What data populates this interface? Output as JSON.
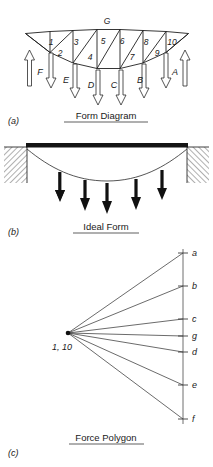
{
  "figure": {
    "background": "#ffffff",
    "ink": "#1a1a1a",
    "width": 213,
    "height": 467
  },
  "panels": [
    {
      "key": "a",
      "tag": "(a)",
      "title": "Form Diagram",
      "title_underlined": true
    },
    {
      "key": "b",
      "tag": "(b)",
      "title": "Ideal Form",
      "title_underlined": true
    },
    {
      "key": "c",
      "tag": "(c)",
      "title": "Force Polygon",
      "title_underlined": true
    }
  ],
  "form_diagram": {
    "top_chord_label": "G",
    "member_numbers": [
      "1",
      "2",
      "3",
      "4",
      "5",
      "6",
      "7",
      "8",
      "9",
      "10"
    ],
    "external_zone_labels": [
      "F",
      "E",
      "D",
      "C",
      "B",
      "A"
    ],
    "reaction_labels": [
      "F",
      "A"
    ],
    "load_labels": [
      "E",
      "D",
      "C",
      "B"
    ],
    "support_reaction_direction": "up",
    "load_direction": "down",
    "top_chord_nodes": [
      {
        "x": 25.5,
        "y": 33.5
      },
      {
        "x": 50.0,
        "y": 31.5
      },
      {
        "x": 73.0,
        "y": 30.5
      },
      {
        "x": 97.0,
        "y": 29.5
      },
      {
        "x": 120.0,
        "y": 29.5
      },
      {
        "x": 143.0,
        "y": 30.5
      },
      {
        "x": 166.0,
        "y": 31.5
      },
      {
        "x": 188.5,
        "y": 33.5
      }
    ],
    "bottom_chord_nodes": [
      {
        "x": 25.5,
        "y": 33.5
      },
      {
        "x": 50.0,
        "y": 52.5
      },
      {
        "x": 73.0,
        "y": 63.0
      },
      {
        "x": 97.0,
        "y": 68.5
      },
      {
        "x": 120.0,
        "y": 68.5
      },
      {
        "x": 143.0,
        "y": 63.0
      },
      {
        "x": 166.0,
        "y": 52.5
      },
      {
        "x": 188.5,
        "y": 33.5
      }
    ],
    "member_number_positions": [
      {
        "label": "1",
        "x": 51,
        "y": 45
      },
      {
        "label": "2",
        "x": 60,
        "y": 55
      },
      {
        "label": "3",
        "x": 76,
        "y": 45
      },
      {
        "label": "4",
        "x": 90,
        "y": 59
      },
      {
        "label": "5",
        "x": 102,
        "y": 44
      },
      {
        "label": "6",
        "x": 122,
        "y": 44
      },
      {
        "label": "7",
        "x": 131,
        "y": 59
      },
      {
        "label": "8",
        "x": 145,
        "y": 45
      },
      {
        "label": "9",
        "x": 158,
        "y": 55
      },
      {
        "label": "10",
        "x": 171,
        "y": 45
      }
    ],
    "zone_label_positions": [
      {
        "label": "F",
        "x": 40,
        "y": 73
      },
      {
        "label": "E",
        "x": 66,
        "y": 80
      },
      {
        "label": "D",
        "x": 94,
        "y": 85
      },
      {
        "label": "C",
        "x": 121,
        "y": 85
      },
      {
        "label": "B",
        "x": 150,
        "y": 80
      },
      {
        "label": "A",
        "x": 175,
        "y": 73
      }
    ],
    "up_arrows": [
      {
        "x": 29.5,
        "y_tip": 52,
        "y_tail": 85
      },
      {
        "x": 185.0,
        "y_tip": 52,
        "y_tail": 85
      }
    ],
    "down_arrows": [
      {
        "x": 51,
        "y_tail": 52,
        "y_tip": 87
      },
      {
        "x": 75,
        "y_tail": 63,
        "y_tip": 97
      },
      {
        "x": 98,
        "y_tail": 69,
        "y_tip": 104
      },
      {
        "x": 121,
        "y_tail": 69,
        "y_tip": 104
      },
      {
        "x": 144,
        "y_tail": 63,
        "y_tip": 97
      },
      {
        "x": 166,
        "y_tail": 52,
        "y_tip": 87
      }
    ]
  },
  "ideal_form": {
    "beam": {
      "x1": 26,
      "x2": 188,
      "y": 146,
      "thickness": 4
    },
    "cable_nodes": [
      {
        "x": 27,
        "y": 150
      },
      {
        "x": 63,
        "y": 172
      },
      {
        "x": 90,
        "y": 180
      },
      {
        "x": 107,
        "y": 181
      },
      {
        "x": 130,
        "y": 178
      },
      {
        "x": 160,
        "y": 165
      },
      {
        "x": 187,
        "y": 150
      }
    ],
    "hatched_supports": [
      {
        "x": 4,
        "y": 147,
        "w": 23,
        "h": 36,
        "side": "left"
      },
      {
        "x": 187,
        "y": 147,
        "w": 23,
        "h": 36,
        "side": "right"
      }
    ],
    "load_arrows": [
      {
        "x": 60,
        "y_tail": 177,
        "y_tip": 202
      },
      {
        "x": 85,
        "y_tail": 185,
        "y_tip": 212
      },
      {
        "x": 107,
        "y_tail": 188,
        "y_tip": 215
      },
      {
        "x": 136,
        "y_tail": 184,
        "y_tip": 211
      },
      {
        "x": 162,
        "y_tail": 175,
        "y_tip": 200
      }
    ]
  },
  "force_polygon": {
    "pole": {
      "x": 68,
      "y": 333,
      "label": "1, 10"
    },
    "pole_label_position": {
      "x": 50,
      "y": 348
    },
    "load_line": {
      "x": 183,
      "y_top": 253,
      "y_bottom": 419
    },
    "points": [
      {
        "label": "a",
        "x": 183,
        "y": 253
      },
      {
        "label": "b",
        "x": 183,
        "y": 286
      },
      {
        "label": "c",
        "x": 183,
        "y": 319
      },
      {
        "label": "g",
        "x": 183,
        "y": 336
      },
      {
        "label": "d",
        "x": 183,
        "y": 352
      },
      {
        "label": "e",
        "x": 183,
        "y": 385
      },
      {
        "label": "f",
        "x": 183,
        "y": 419
      }
    ],
    "label_offset_x": 8,
    "ray_count": 7
  },
  "captions": {
    "a_tag_pos": {
      "x": 8,
      "y": 122
    },
    "a_title_pos": {
      "x": 106,
      "y": 119
    },
    "b_tag_pos": {
      "x": 8,
      "y": 232
    },
    "b_title_pos": {
      "x": 106,
      "y": 230
    },
    "c_tag_pos": {
      "x": 8,
      "y": 452
    },
    "c_title_pos": {
      "x": 106,
      "y": 441
    }
  }
}
